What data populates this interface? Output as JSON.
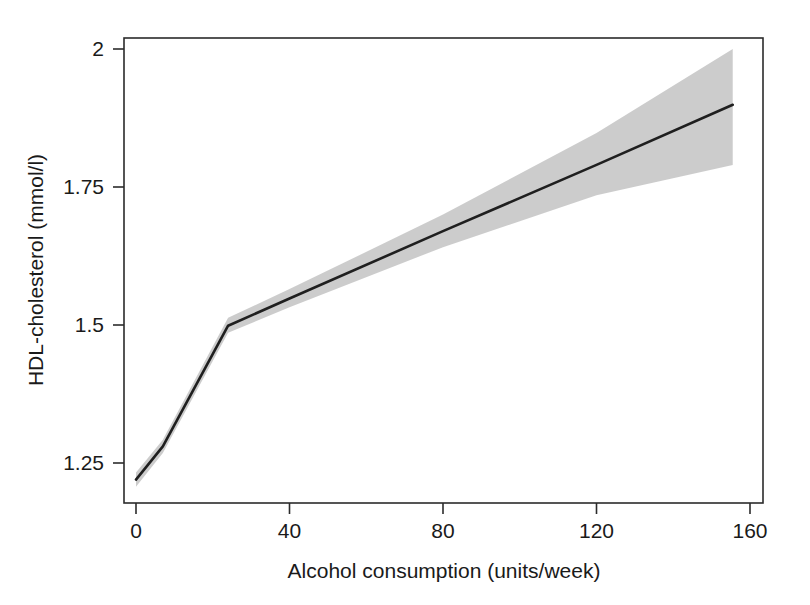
{
  "chart_data": {
    "type": "line",
    "title": "",
    "subtitle": "",
    "xlabel": "Alcohol consumption (units/week)",
    "ylabel": "HDL-cholesterol (mmol/l)",
    "xlim": [
      -3,
      163
    ],
    "ylim": [
      1.16,
      2.02
    ],
    "xticks": [
      0,
      40,
      80,
      120,
      160
    ],
    "xtick_labels": [
      "0",
      "40",
      "80",
      "120",
      "160"
    ],
    "yticks": [
      1.25,
      1.5,
      1.75,
      2
    ],
    "ytick_labels": [
      "1.25",
      "1.5",
      "1.75",
      "2"
    ],
    "grid": false,
    "legend": null,
    "annotations": [],
    "series": [
      {
        "name": "Fitted HDL-cholesterol",
        "kind": "line",
        "color": "#1f1f1f",
        "x": [
          0,
          7,
          24,
          40,
          80,
          120,
          155.5
        ],
        "values": [
          1.22,
          1.28,
          1.4987,
          1.548,
          1.67,
          1.79,
          1.899
        ]
      },
      {
        "name": "95% confidence interval",
        "kind": "band",
        "color": "#c9c9c9",
        "x": [
          0,
          7,
          24,
          40,
          80,
          120,
          155.5
        ],
        "lower": [
          1.207,
          1.268,
          1.486,
          1.532,
          1.641,
          1.735,
          1.79
        ],
        "upper": [
          1.233,
          1.292,
          1.513,
          1.565,
          1.7,
          1.848,
          2.0
        ]
      }
    ]
  },
  "axes": {
    "y_title": "HDL-cholesterol (mmol/l)",
    "x_title": "Alcohol consumption (units/week)"
  },
  "colors": {
    "line": "#1f1f1f",
    "band": "#c9c9c9",
    "frame": "#2b2b2b",
    "text": "#1a1a1a",
    "background": "#ffffff"
  }
}
